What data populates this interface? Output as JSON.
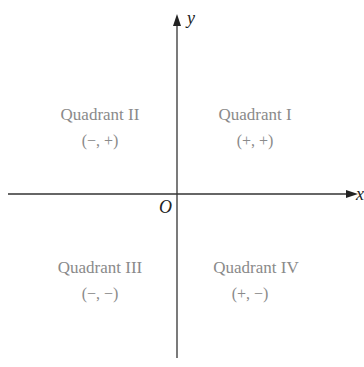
{
  "diagram": {
    "axes": {
      "x_label": "x",
      "y_label": "y",
      "origin_label": "O"
    },
    "quadrants": [
      {
        "name": "Quadrant I",
        "signs": "(+, +)"
      },
      {
        "name": "Quadrant II",
        "signs": "(−, +)"
      },
      {
        "name": "Quadrant III",
        "signs": "(−, −)"
      },
      {
        "name": "Quadrant IV",
        "signs": "(+, −)"
      }
    ],
    "colors": {
      "axis": "#333333",
      "label": "#8a8a8a",
      "text": "#222222"
    }
  }
}
